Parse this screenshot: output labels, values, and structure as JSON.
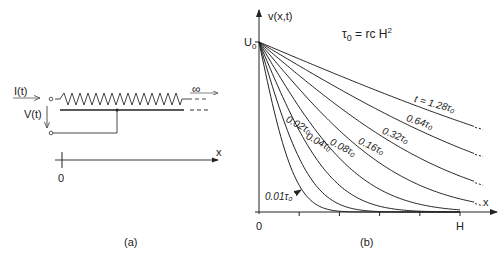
{
  "panel_a": {
    "caption": "(a)",
    "current_label": "I(t)",
    "voltage_label": "V(t)",
    "infinity_label": "∞",
    "axis_label": "x",
    "origin_label": "0"
  },
  "panel_b": {
    "caption": "(b)",
    "y_axis_label": "v(x,t)",
    "x_axis_label": "x",
    "formula": "τ₀ = rcH²",
    "y_max_label": "U₀",
    "x_origin_label": "0",
    "x_end_label": "H"
  },
  "chart_data": {
    "type": "line",
    "xlabel": "x",
    "ylabel": "v(x,t)",
    "x_ticks": [
      "0",
      "",
      "",
      "",
      "",
      "H"
    ],
    "y_ticks": [
      "U₀"
    ],
    "xlim": [
      0,
      1.2
    ],
    "ylim": [
      0,
      1
    ],
    "grid": false,
    "model": "v(x,t) = U0 · erfc( x / (2·sqrt(t/(r c))) ), x in units of H, t in units of τ0",
    "series": [
      {
        "name": "0.01τ₀",
        "t": 0.01,
        "label": "0.01τ₀"
      },
      {
        "name": "0.02τ₀",
        "t": 0.02,
        "label": "0.02τ₀"
      },
      {
        "name": "0.04τ₀",
        "t": 0.04,
        "label": "0.04τ₀"
      },
      {
        "name": "0.08τ₀",
        "t": 0.08,
        "label": "0.08τ₀"
      },
      {
        "name": "0.16τ₀",
        "t": 0.16,
        "label": "0.16τ₀"
      },
      {
        "name": "0.32τ₀",
        "t": 0.32,
        "label": "0.32τ₀"
      },
      {
        "name": "0.64τ₀",
        "t": 0.64,
        "label": "0.64τ₀"
      },
      {
        "name": "t = 1.28τ₀",
        "t": 1.28,
        "label": "t = 1.28τ₀"
      }
    ]
  }
}
